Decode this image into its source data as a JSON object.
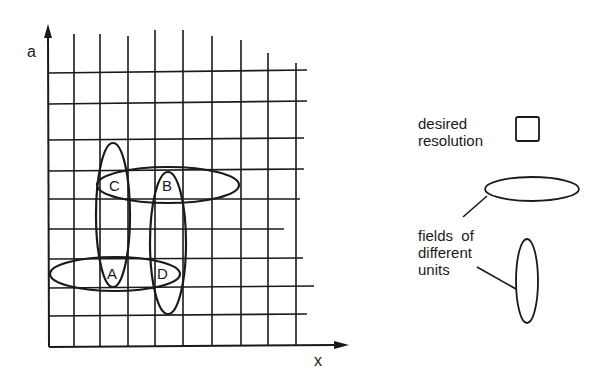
{
  "axes": {
    "y_label": "a",
    "x_label": "x"
  },
  "cells": {
    "A": "A",
    "B": "B",
    "C": "C",
    "D": "D"
  },
  "legend": {
    "desired_resolution_line1": "desired",
    "desired_resolution_line2": "resolution",
    "fields_line1": "fields  of",
    "fields_line2": "different",
    "fields_line3": "units"
  },
  "colors": {
    "ink": "#1a1a1a",
    "background": "#ffffff"
  }
}
